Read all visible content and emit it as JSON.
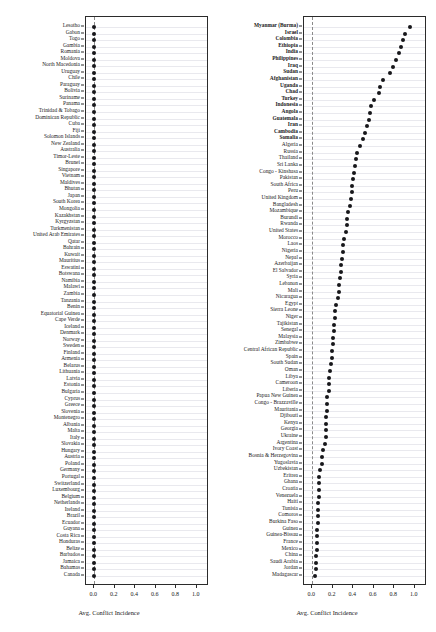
{
  "figure": {
    "width": 436,
    "height": 632,
    "background": "#ffffff",
    "dot_color": "#17171a",
    "grid_color": "#e9e9ee",
    "axis_color": "#2b2b2b",
    "reference_line_color": "#8a8a8a"
  },
  "chart_data": [
    {
      "type": "scatter",
      "panel": "left",
      "title": "",
      "xlabel": "Avg. Conflict Incidence",
      "ylabel": "",
      "xlim": [
        -0.08,
        1.12
      ],
      "xticks": [
        0.0,
        0.2,
        0.4,
        0.6,
        0.8,
        1.0
      ],
      "xticklabels": [
        "0.0",
        "0.2",
        "0.4",
        "0.6",
        "0.8",
        "1.0"
      ],
      "grid": true,
      "reference_line_x": 0.0,
      "orientation": "horizontal-dot",
      "categories": [
        "Lesotho",
        "Gabon",
        "Togo",
        "Gambia",
        "Romania",
        "Moldova",
        "North Macedonia",
        "Uruguay",
        "Chile",
        "Paraguay",
        "Bolivia",
        "Suriname",
        "Panama",
        "Trinidad & Tobago",
        "Dominican Republic",
        "Cuba",
        "Fiji",
        "Solomon Islands",
        "New Zealand",
        "Australia",
        "Timor-Leste",
        "Brunei",
        "Singapore",
        "Vietnam",
        "Maldives",
        "Bhutan",
        "Japan",
        "South Korea",
        "Mongolia",
        "Kazakhstan",
        "Kyrgyzstan",
        "Turkmenistan",
        "United Arab Emirates",
        "Qatar",
        "Bahrain",
        "Kuwait",
        "Mauritius",
        "Eswatini",
        "Botswana",
        "Namibia",
        "Malawi",
        "Zambia",
        "Tanzania",
        "Benin",
        "Equatorial Guinea",
        "Cape Verde",
        "Iceland",
        "Denmark",
        "Norway",
        "Sweden",
        "Finland",
        "Armenia",
        "Belarus",
        "Lithuania",
        "Latvia",
        "Estonia",
        "Bulgaria",
        "Cyprus",
        "Greece",
        "Slovenia",
        "Montenegro",
        "Albania",
        "Malta",
        "Italy",
        "Slovakia",
        "Hungary",
        "Austria",
        "Poland",
        "Germany",
        "Portugal",
        "Switzerland",
        "Luxembourg",
        "Belgium",
        "Netherlands",
        "Ireland",
        "Brazil",
        "Ecuador",
        "Guyana",
        "Costa Rica",
        "Honduras",
        "Belize",
        "Barbados",
        "Jamaica",
        "Bahamas",
        "Canada"
      ],
      "values": [
        0.0,
        0.0,
        0.0,
        0.0,
        0.0,
        0.0,
        0.0,
        0.0,
        0.0,
        0.0,
        0.0,
        0.0,
        0.0,
        0.0,
        0.0,
        0.0,
        0.0,
        0.0,
        0.0,
        0.0,
        0.0,
        0.0,
        0.0,
        0.0,
        0.0,
        0.0,
        0.0,
        0.0,
        0.0,
        0.0,
        0.0,
        0.0,
        0.0,
        0.0,
        0.0,
        0.0,
        0.0,
        0.0,
        0.0,
        0.0,
        0.0,
        0.0,
        0.0,
        0.0,
        0.0,
        0.0,
        0.0,
        0.0,
        0.0,
        0.0,
        0.0,
        0.0,
        0.0,
        0.0,
        0.0,
        0.0,
        0.0,
        0.0,
        0.0,
        0.0,
        0.0,
        0.0,
        0.0,
        0.0,
        0.0,
        0.0,
        0.0,
        0.0,
        0.0,
        0.0,
        0.0,
        0.0,
        0.0,
        0.0,
        0.0,
        0.0,
        0.0,
        0.0,
        0.0,
        0.0,
        0.0,
        0.0,
        0.0,
        0.0,
        0.0
      ],
      "bold_categories": []
    },
    {
      "type": "scatter",
      "panel": "right",
      "title": "",
      "xlabel": "Avg. Conflict Incidence",
      "ylabel": "",
      "xlim": [
        -0.08,
        1.12
      ],
      "xticks": [
        0.0,
        0.2,
        0.4,
        0.6,
        0.8,
        1.0
      ],
      "xticklabels": [
        "0.0",
        "0.2",
        "0.4",
        "0.6",
        "0.8",
        "1.0"
      ],
      "grid": true,
      "reference_line_x": 0.0,
      "orientation": "horizontal-dot",
      "categories": [
        "Myanmar (Burma)",
        "Israel",
        "Colombia",
        "Ethiopia",
        "India",
        "Philippines",
        "Iraq",
        "Sudan",
        "Afghanistan",
        "Uganda",
        "Chad",
        "Turkey",
        "Indonesia",
        "Angola",
        "Guatemala",
        "Iran",
        "Cambodia",
        "Somalia",
        "Algeria",
        "Russia",
        "Thailand",
        "Sri Lanka",
        "Congo - Kinshasa",
        "Pakistan",
        "South Africa",
        "Peru",
        "United Kingdom",
        "Bangladesh",
        "Mozambique",
        "Burundi",
        "Rwanda",
        "United States",
        "Morocco",
        "Laos",
        "Nigeria",
        "Nepal",
        "Azerbaijan",
        "El Salvador",
        "Syria",
        "Lebanon",
        "Mali",
        "Nicaragua",
        "Egypt",
        "Sierra Leone",
        "Niger",
        "Tajikistan",
        "Senegal",
        "Malaysia",
        "Zimbabwe",
        "Central African Republic",
        "Spain",
        "South Sudan",
        "Oman",
        "Libya",
        "Cameroon",
        "Liberia",
        "Papua New Guinea",
        "Congo - Brazzaville",
        "Mauritania",
        "Djibouti",
        "Kenya",
        "Georgia",
        "Ukraine",
        "Argentina",
        "Ivory Coast",
        "Bosnia & Herzegovina",
        "Yugoslavia",
        "Uzbekistan",
        "Eritrea",
        "Ghana",
        "Croatia",
        "Venezuela",
        "Haiti",
        "Tunisia",
        "Comoros",
        "Burkina Faso",
        "Guinea",
        "Guinea-Bissau",
        "France",
        "Mexico",
        "China",
        "Saudi Arabia",
        "Jordan",
        "Madagascar"
      ],
      "values": [
        0.955,
        0.905,
        0.885,
        0.865,
        0.845,
        0.82,
        0.79,
        0.76,
        0.69,
        0.665,
        0.655,
        0.6,
        0.575,
        0.56,
        0.55,
        0.53,
        0.515,
        0.5,
        0.47,
        0.44,
        0.425,
        0.42,
        0.405,
        0.395,
        0.39,
        0.385,
        0.38,
        0.37,
        0.345,
        0.34,
        0.335,
        0.325,
        0.31,
        0.3,
        0.3,
        0.29,
        0.285,
        0.28,
        0.275,
        0.265,
        0.26,
        0.255,
        0.23,
        0.225,
        0.22,
        0.215,
        0.21,
        0.205,
        0.2,
        0.195,
        0.19,
        0.185,
        0.17,
        0.165,
        0.165,
        0.16,
        0.145,
        0.145,
        0.14,
        0.135,
        0.135,
        0.13,
        0.13,
        0.125,
        0.11,
        0.1,
        0.095,
        0.075,
        0.07,
        0.07,
        0.065,
        0.065,
        0.06,
        0.055,
        0.055,
        0.055,
        0.05,
        0.05,
        0.05,
        0.045,
        0.04,
        0.035,
        0.035,
        0.03
      ],
      "bold_categories": [
        "Myanmar (Burma)",
        "Israel",
        "Colombia",
        "Ethiopia",
        "India",
        "Philippines",
        "Iraq",
        "Sudan",
        "Afghanistan",
        "Uganda",
        "Chad",
        "Turkey",
        "Indonesia",
        "Angola",
        "Guatemala",
        "Iran",
        "Cambodia",
        "Somalia"
      ]
    }
  ]
}
